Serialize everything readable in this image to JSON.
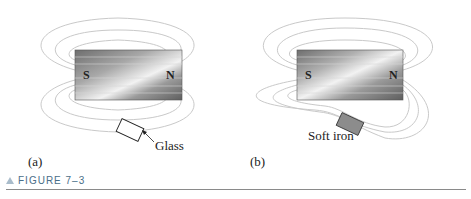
{
  "figure": {
    "caption": "FIGURE 7–3",
    "panels": [
      {
        "id": "a",
        "label": "(a)",
        "south_pole": "S",
        "north_pole": "N",
        "material": "Glass"
      },
      {
        "id": "b",
        "label": "(b)",
        "south_pole": "S",
        "north_pole": "N",
        "material": "Soft iron"
      }
    ]
  },
  "colors": {
    "field_line": "#c9c9c9",
    "magnet_dark": "#6e6e6e",
    "magnet_light": "#f2f2f2",
    "caption_text": "#4a6e88",
    "caption_triangle": "#a9bccb",
    "rule": "#8a8a8a"
  }
}
